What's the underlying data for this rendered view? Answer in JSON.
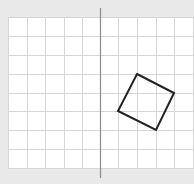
{
  "diagram": {
    "type": "grid-reflection",
    "colors": {
      "background": "#e9e9e9",
      "grid_fill": "#ffffff",
      "grid_line": "#d6d6d6",
      "axis_line": "#8a8a8a",
      "shape_stroke": "#222222"
    },
    "grid": {
      "x0": 8,
      "y0": 17,
      "x1": 194,
      "y1": 168,
      "columns_x": [
        8,
        27,
        45,
        64,
        82,
        100,
        118,
        137,
        156,
        174,
        193
      ],
      "rows_y": [
        17,
        36,
        55,
        74,
        93,
        111,
        130,
        149,
        168
      ]
    },
    "mirror_line": {
      "x": 100,
      "y_top": 8,
      "y_bottom": 178
    },
    "shape": {
      "name": "rotated-square",
      "points": [
        [
          137,
          74
        ],
        [
          174,
          93
        ],
        [
          156,
          130
        ],
        [
          118,
          111
        ]
      ]
    }
  }
}
